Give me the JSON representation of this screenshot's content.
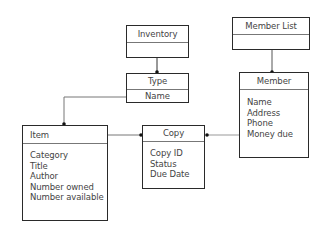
{
  "diagram": {
    "type": "uml-class-diagram",
    "classes": [
      {
        "id": "inventory",
        "name": "Inventory",
        "attributes": []
      },
      {
        "id": "type",
        "name": "Type",
        "attributes": [
          "Name"
        ]
      },
      {
        "id": "member_list",
        "name": "Member List",
        "attributes": []
      },
      {
        "id": "member",
        "name": "Member",
        "attributes": [
          "Name",
          "Address",
          "Phone",
          "Money due"
        ]
      },
      {
        "id": "item",
        "name": "Item",
        "attributes": [
          "Category",
          "Title",
          "Author",
          "Number owned",
          "Number available"
        ]
      },
      {
        "id": "copy",
        "name": "Copy",
        "attributes": [
          "Copy ID",
          "Status",
          "Due Date"
        ]
      }
    ],
    "associations": [
      {
        "from": "Inventory",
        "to": "Type",
        "end_marker": "filled-dot-at-Type"
      },
      {
        "from": "Member List",
        "to": "Member",
        "end_marker": "filled-dot-at-Member"
      },
      {
        "from": "Type",
        "to": "Item",
        "end_marker": "filled-dot-at-Item"
      },
      {
        "from": "Item",
        "to": "Copy",
        "end_marker": "filled-dot-at-Copy"
      },
      {
        "from": "Member",
        "to": "Copy",
        "end_marker": "filled-dot-at-Copy"
      }
    ]
  },
  "colors": {
    "line": "#2a2a2a",
    "text": "#444444",
    "background": "#ffffff"
  }
}
